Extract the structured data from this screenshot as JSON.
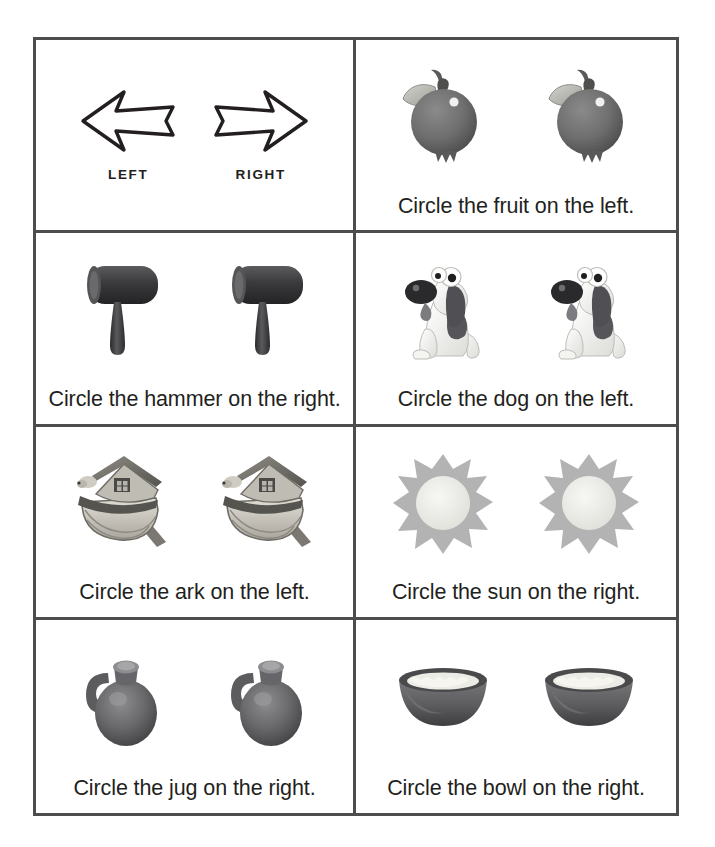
{
  "worksheet": {
    "title": "Left and Right — Circle the picture",
    "border_color": "#4d4d4f",
    "text_color": "#231f20",
    "background": "#ffffff",
    "columns": 2,
    "rows": 4
  },
  "legend": {
    "left_arrow_label": "LEFT",
    "right_arrow_label": "RIGHT",
    "left_arrow_icon": "arrow-left-outline-icon",
    "right_arrow_icon": "arrow-right-outline-icon"
  },
  "cells": [
    {
      "id": "legend",
      "kind": "legend",
      "caption": "",
      "icon": "arrows-left-right-icon",
      "count": 0
    },
    {
      "id": "fruit",
      "kind": "question",
      "caption": "Circle the fruit on the left.",
      "icon": "pomegranate-fruit-icon",
      "subject": "fruit",
      "answer": "left",
      "count": 2
    },
    {
      "id": "hammer",
      "kind": "question",
      "caption": "Circle the hammer on the right.",
      "icon": "mallet-hammer-icon",
      "subject": "hammer",
      "answer": "right",
      "count": 2
    },
    {
      "id": "dog",
      "kind": "question",
      "caption": "Circle the dog on the left.",
      "icon": "cartoon-dog-icon",
      "subject": "dog",
      "answer": "left",
      "count": 2
    },
    {
      "id": "ark",
      "kind": "question",
      "caption": "Circle the ark on the left.",
      "icon": "noahs-ark-icon",
      "subject": "ark",
      "answer": "left",
      "count": 2
    },
    {
      "id": "sun",
      "kind": "question",
      "caption": "Circle the sun on the right.",
      "icon": "sun-burst-icon",
      "subject": "sun",
      "answer": "right",
      "count": 2
    },
    {
      "id": "jug",
      "kind": "question",
      "caption": "Circle the jug on the right.",
      "icon": "clay-jug-icon",
      "subject": "jug",
      "answer": "right",
      "count": 2
    },
    {
      "id": "bowl",
      "kind": "question",
      "caption": "Circle the bowl on the right.",
      "icon": "clay-bowl-icon",
      "subject": "bowl",
      "answer": "right",
      "count": 2
    }
  ],
  "palette": {
    "ink": "#231f20",
    "rule": "#4d4d4f",
    "fruit_body": "#6e6e6e",
    "fruit_leaf": "#b9b9b4",
    "hammer_head": "#3c3c3e",
    "hammer_handle": "#4a4a4c",
    "dog_body": "#f2f2f0",
    "dog_spot": "#4f4f51",
    "ark_hull": "#cfcbc2",
    "ark_roof": "#8d8a84",
    "sun_rays": "#b3b3b3",
    "sun_core": "#ededea",
    "jug_body": "#6b6b6d",
    "bowl_body": "#5f5f61",
    "bowl_content": "#eceae4"
  }
}
